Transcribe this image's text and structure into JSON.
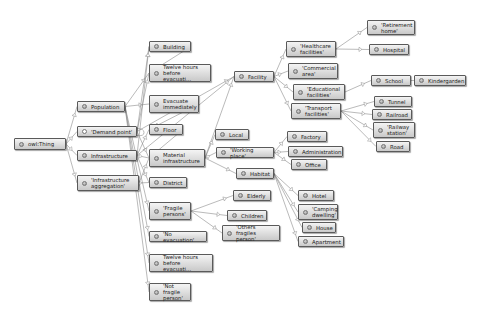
{
  "diagram": {
    "nodes": [
      {
        "id": "thing",
        "label": "owl:Thing"
      },
      {
        "id": "population",
        "label": "Population"
      },
      {
        "id": "demand",
        "label": "'Demand point'"
      },
      {
        "id": "infrastructure",
        "label": "Infrastructure"
      },
      {
        "id": "infraagg",
        "label": "'Infrastructure\naggregation'"
      },
      {
        "id": "building",
        "label": "Building"
      },
      {
        "id": "twelve1",
        "label": "Twelve hours\nbefore evacuati..."
      },
      {
        "id": "evacuate",
        "label": "Evacuate\nimmediately"
      },
      {
        "id": "floor",
        "label": "Floor"
      },
      {
        "id": "material",
        "label": "Material\ninfrastructure"
      },
      {
        "id": "district",
        "label": "District"
      },
      {
        "id": "fragile",
        "label": "'Fragile\npersons'"
      },
      {
        "id": "noevac",
        "label": "'No evacuation'"
      },
      {
        "id": "twelve2",
        "label": "Twelve hours\nbefore evacuati..."
      },
      {
        "id": "notfragile",
        "label": "'Not fragile\nperson'"
      },
      {
        "id": "facility",
        "label": "Facility"
      },
      {
        "id": "local",
        "label": "Local"
      },
      {
        "id": "working",
        "label": "'Working place'"
      },
      {
        "id": "habitat",
        "label": "Habitat"
      },
      {
        "id": "elderly",
        "label": "Elderly"
      },
      {
        "id": "children",
        "label": "Children"
      },
      {
        "id": "otherfragile",
        "label": "'Others fragiles\nperson'"
      },
      {
        "id": "healthcare",
        "label": "'Healthcare\nfacilities'"
      },
      {
        "id": "commercial",
        "label": "'Commercial\narea'"
      },
      {
        "id": "educational",
        "label": "'Educational\nfacilities'"
      },
      {
        "id": "transport",
        "label": "'Transport\nfacilities'"
      },
      {
        "id": "retirement",
        "label": "'Retirement\nhome'"
      },
      {
        "id": "hospital",
        "label": "Hospital"
      },
      {
        "id": "school",
        "label": "School"
      },
      {
        "id": "kindergarden",
        "label": "Kindergarden"
      },
      {
        "id": "tunnel",
        "label": "Tunnel"
      },
      {
        "id": "railroad",
        "label": "Railroad"
      },
      {
        "id": "railway",
        "label": "'Railway\nstation'"
      },
      {
        "id": "road",
        "label": "Road"
      },
      {
        "id": "factory",
        "label": "Factory"
      },
      {
        "id": "administration",
        "label": "Administration"
      },
      {
        "id": "office",
        "label": "Office"
      },
      {
        "id": "hotel",
        "label": "Hotel"
      },
      {
        "id": "camping",
        "label": "'Camping\ndwelling'"
      },
      {
        "id": "house",
        "label": "House"
      },
      {
        "id": "apartment",
        "label": "Apartment"
      }
    ],
    "edges": [
      [
        "thing",
        "population"
      ],
      [
        "thing",
        "demand"
      ],
      [
        "thing",
        "infrastructure"
      ],
      [
        "thing",
        "infraagg"
      ],
      [
        "population",
        "evacuate"
      ],
      [
        "population",
        "twelve1"
      ],
      [
        "population",
        "fragile"
      ],
      [
        "population",
        "noevac"
      ],
      [
        "population",
        "twelve2"
      ],
      [
        "population",
        "notfragile"
      ],
      [
        "demand",
        "demand"
      ],
      [
        "demand",
        "building"
      ],
      [
        "demand",
        "twelve1"
      ],
      [
        "demand",
        "material"
      ],
      [
        "demand",
        "facility"
      ],
      [
        "infrastructure",
        "building"
      ],
      [
        "infrastructure",
        "floor"
      ],
      [
        "infrastructure",
        "material"
      ],
      [
        "infrastructure",
        "district"
      ],
      [
        "infrastructure",
        "facility"
      ],
      [
        "infraagg",
        "district"
      ],
      [
        "infraagg",
        "material"
      ],
      [
        "building",
        "twelve1"
      ],
      [
        "evacuate",
        "floor"
      ],
      [
        "floor",
        "material"
      ],
      [
        "material",
        "facility"
      ],
      [
        "material",
        "local"
      ],
      [
        "material",
        "working"
      ],
      [
        "material",
        "habitat"
      ],
      [
        "fragile",
        "elderly"
      ],
      [
        "fragile",
        "children"
      ],
      [
        "fragile",
        "otherfragile"
      ],
      [
        "facility",
        "healthcare"
      ],
      [
        "facility",
        "commercial"
      ],
      [
        "facility",
        "educational"
      ],
      [
        "facility",
        "transport"
      ],
      [
        "healthcare",
        "retirement"
      ],
      [
        "healthcare",
        "hospital"
      ],
      [
        "educational",
        "school"
      ],
      [
        "school",
        "kindergarden"
      ],
      [
        "transport",
        "tunnel"
      ],
      [
        "transport",
        "railroad"
      ],
      [
        "transport",
        "railway"
      ],
      [
        "transport",
        "road"
      ],
      [
        "working",
        "factory"
      ],
      [
        "working",
        "administration"
      ],
      [
        "working",
        "office"
      ],
      [
        "habitat",
        "hotel"
      ],
      [
        "habitat",
        "camping"
      ],
      [
        "habitat",
        "house"
      ],
      [
        "habitat",
        "apartment"
      ]
    ]
  },
  "colors": {
    "node_border": "#5a5a5a",
    "edge": "#8c8c8c",
    "background": "#ffffff"
  }
}
